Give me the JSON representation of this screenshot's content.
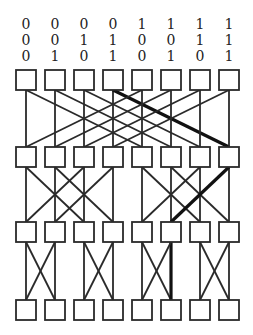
{
  "diagram": {
    "type": "butterfly-network",
    "columns": 8,
    "stages": 4,
    "address_labels": [
      [
        "0",
        "0",
        "0",
        "0",
        "1",
        "1",
        "1",
        "1"
      ],
      [
        "0",
        "0",
        "1",
        "1",
        "0",
        "0",
        "1",
        "1"
      ],
      [
        "0",
        "1",
        "0",
        "1",
        "0",
        "1",
        "0",
        "1"
      ]
    ],
    "box_x": [
      16,
      45,
      74,
      103,
      132,
      161,
      190,
      219
    ],
    "row_y": [
      70,
      147,
      222,
      300
    ],
    "box_size": 20,
    "connection_distances": [
      4,
      2,
      1
    ],
    "highlighted_path": [
      3,
      7,
      5,
      5
    ],
    "line_color": "#2a2a2a",
    "highlight_color": "#111111"
  }
}
